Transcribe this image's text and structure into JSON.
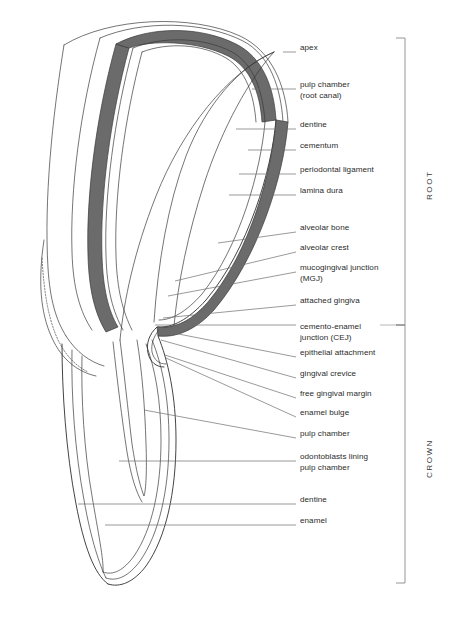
{
  "figure": {
    "colors": {
      "outline": "#2f2f2f",
      "band_fill": "#6b6b6b",
      "leader": "#6e6e6e",
      "bracket": "#8a8a8a",
      "background": "#ffffff",
      "text": "#2b2b2b"
    }
  },
  "labels": [
    {
      "id": "apex",
      "text": "apex",
      "x": 300,
      "y": 48,
      "leader": {
        "x1": 283,
        "y1": 52,
        "x2": 296,
        "y2": 52
      }
    },
    {
      "id": "pulp-chamber-root",
      "text": "pulp chamber\n(root canal)",
      "x": 300,
      "y": 85,
      "leader": {
        "x1": 252,
        "y1": 89,
        "x2": 296,
        "y2": 89
      }
    },
    {
      "id": "dentine-root",
      "text": "dentine",
      "x": 300,
      "y": 125,
      "leader": {
        "x1": 236,
        "y1": 129,
        "x2": 296,
        "y2": 129
      }
    },
    {
      "id": "cementum",
      "text": "cementum",
      "x": 300,
      "y": 146,
      "leader": {
        "x1": 248,
        "y1": 150,
        "x2": 296,
        "y2": 150
      }
    },
    {
      "id": "periodontal-ligament",
      "text": "periodontal ligament",
      "x": 300,
      "y": 170,
      "leader": {
        "x1": 239,
        "y1": 174,
        "x2": 296,
        "y2": 174
      }
    },
    {
      "id": "lamina-dura",
      "text": "lamina dura",
      "x": 300,
      "y": 191,
      "leader": {
        "x1": 229,
        "y1": 195,
        "x2": 296,
        "y2": 195
      }
    },
    {
      "id": "alveolar-bone",
      "text": "alveolar bone",
      "x": 300,
      "y": 228,
      "leader": {
        "x1": 218,
        "y1": 243,
        "x2": 296,
        "y2": 232
      }
    },
    {
      "id": "alveolar-crest",
      "text": "alveolar crest",
      "x": 300,
      "y": 248,
      "leader": {
        "x1": 175,
        "y1": 281,
        "x2": 296,
        "y2": 252
      }
    },
    {
      "id": "mucogingival-junction",
      "text": "mucogingival junction\n(MGJ)",
      "x": 300,
      "y": 268,
      "leader": {
        "x1": 168,
        "y1": 296,
        "x2": 296,
        "y2": 272
      }
    },
    {
      "id": "attached-gingiva",
      "text": "attached gingiva",
      "x": 300,
      "y": 301,
      "leader": {
        "x1": 163,
        "y1": 318,
        "x2": 296,
        "y2": 305
      }
    },
    {
      "id": "cemento-enamel-junction",
      "text": "cemento-enamel\njunction (CEJ)",
      "x": 300,
      "y": 327,
      "leader": {
        "x1": 155,
        "y1": 325,
        "x2": 296,
        "y2": 325
      }
    },
    {
      "id": "epithelial-attachment",
      "text": "epithelial attachment",
      "x": 300,
      "y": 353,
      "leader": {
        "x1": 158,
        "y1": 330,
        "x2": 296,
        "y2": 357
      }
    },
    {
      "id": "gingival-crevice",
      "text": "gingival crevice",
      "x": 300,
      "y": 374,
      "leader": {
        "x1": 161,
        "y1": 340,
        "x2": 296,
        "y2": 378
      }
    },
    {
      "id": "free-gingival-margin",
      "text": "free gingival margin",
      "x": 300,
      "y": 394,
      "leader": {
        "x1": 165,
        "y1": 355,
        "x2": 296,
        "y2": 398
      }
    },
    {
      "id": "enamel-bulge",
      "text": "enamel bulge",
      "x": 300,
      "y": 413,
      "leader": {
        "x1": 166,
        "y1": 358,
        "x2": 296,
        "y2": 417
      }
    },
    {
      "id": "pulp-chamber-crown",
      "text": "pulp chamber",
      "x": 300,
      "y": 434,
      "leader": {
        "x1": 144,
        "y1": 410,
        "x2": 296,
        "y2": 438
      }
    },
    {
      "id": "odontoblasts",
      "text": "odontoblasts lining\npulp chamber",
      "x": 300,
      "y": 457,
      "leader": {
        "x1": 119,
        "y1": 461,
        "x2": 296,
        "y2": 461
      }
    },
    {
      "id": "dentine-crown",
      "text": "dentine",
      "x": 300,
      "y": 500,
      "leader": {
        "x1": 78,
        "y1": 504,
        "x2": 296,
        "y2": 504
      }
    },
    {
      "id": "enamel",
      "text": "enamel",
      "x": 300,
      "y": 521,
      "leader": {
        "x1": 105,
        "y1": 525,
        "x2": 296,
        "y2": 525
      }
    }
  ],
  "regions": [
    {
      "id": "root",
      "label": "ROOT",
      "bracket_top": 38,
      "bracket_bottom": 325,
      "text_x": 425,
      "text_y": 200
    },
    {
      "id": "crown",
      "label": "CROWN",
      "bracket_top": 325,
      "bracket_bottom": 583,
      "text_x": 425,
      "text_y": 478
    }
  ],
  "bracket": {
    "x": 405,
    "tick_length": 9
  }
}
